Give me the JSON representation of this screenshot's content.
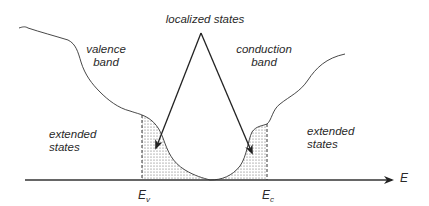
{
  "diagram": {
    "title_label": "localized states",
    "valence_band": {
      "line1": "valence",
      "line2": "band"
    },
    "conduction_band": {
      "line1": "conduction",
      "line2": "band"
    },
    "extended_left": {
      "line1": "extended",
      "line2": "states"
    },
    "extended_right": {
      "line1": "extended",
      "line2": "states"
    },
    "axis_label": "E",
    "ev_label": {
      "main": "E",
      "sub": "v"
    },
    "ec_label": {
      "main": "E",
      "sub": "c"
    },
    "colors": {
      "line": "#333333",
      "stipple": "#555555",
      "background": "#ffffff"
    }
  }
}
